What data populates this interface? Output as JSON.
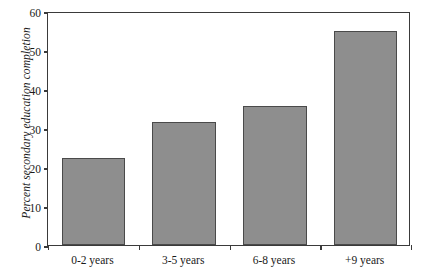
{
  "chart_data": {
    "type": "bar",
    "title": "",
    "subtitle": "",
    "xlabel": "",
    "ylabel": "Percent secondary education completion",
    "categories": [
      "0-2 years",
      "3-5 years",
      "6-8 years",
      "+9 years"
    ],
    "values": [
      22.3,
      31.5,
      35.6,
      54.9
    ],
    "ylim": [
      0,
      60
    ],
    "yticks": [
      0,
      10,
      20,
      30,
      40,
      50,
      60
    ],
    "ytick_labels": [
      "0",
      "10",
      "20",
      "30",
      "40",
      "50",
      "60"
    ],
    "grid": false,
    "legend": null,
    "legend_position": "none",
    "annotations": [],
    "series": [
      {
        "name": "Percent secondary education completion",
        "values": [
          22.3,
          31.5,
          35.6,
          54.9
        ]
      }
    ],
    "colors": {
      "bar_fill": "#8e8e8e",
      "bar_edge": "#4a4a4a",
      "axis": "#3a3a3a",
      "text": "#1a1a1a",
      "background": "#ffffff"
    }
  }
}
